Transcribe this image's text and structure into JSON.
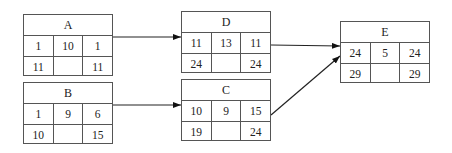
{
  "nodes": {
    "A": {
      "label": "A",
      "es": "1",
      "dur": "10",
      "ef": "1",
      "ls": "11",
      "mid": "",
      "lf": "11"
    },
    "B": {
      "label": "B",
      "es": "1",
      "dur": "9",
      "ef": "6",
      "ls": "10",
      "mid": "",
      "lf": "15"
    },
    "D": {
      "label": "D",
      "es": "11",
      "dur": "13",
      "ef": "11",
      "ls": "24",
      "mid": "",
      "lf": "24"
    },
    "C": {
      "label": "C",
      "es": "10",
      "dur": "9",
      "ef": "15",
      "ls": "19",
      "mid": "",
      "lf": "24"
    },
    "E": {
      "label": "E",
      "es": "24",
      "dur": "5",
      "ef": "24",
      "ls": "29",
      "mid": "",
      "lf": "29"
    }
  },
  "edges": [
    {
      "from": "A",
      "to": "D"
    },
    {
      "from": "B",
      "to": "C"
    },
    {
      "from": "D",
      "to": "E"
    },
    {
      "from": "C",
      "to": "E"
    }
  ],
  "colors": {
    "line": "#222222",
    "border": "#555555"
  }
}
